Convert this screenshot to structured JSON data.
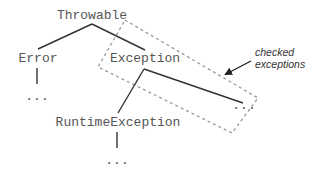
{
  "diagram": {
    "type": "class-hierarchy-tree",
    "nodes": {
      "root": {
        "label": "Throwable"
      },
      "error": {
        "label": "Error"
      },
      "exception": {
        "label": "Exception"
      },
      "runtime": {
        "label": "RuntimeException"
      },
      "error_more": {
        "label": "..."
      },
      "exception_more": {
        "label": "..."
      },
      "runtime_more": {
        "label": "..."
      }
    },
    "edges": [
      {
        "from": "Throwable",
        "to": "Error"
      },
      {
        "from": "Throwable",
        "to": "Exception"
      },
      {
        "from": "Error",
        "to": "..."
      },
      {
        "from": "Exception",
        "to": "RuntimeException"
      },
      {
        "from": "Exception",
        "to": "..."
      },
      {
        "from": "RuntimeException",
        "to": "..."
      }
    ],
    "annotation": {
      "line1": "checked",
      "line2": "exceptions"
    },
    "colors": {
      "text": "#555555",
      "edge": "#333333",
      "dashed_box": "#999999",
      "background": "#ffffff"
    }
  }
}
